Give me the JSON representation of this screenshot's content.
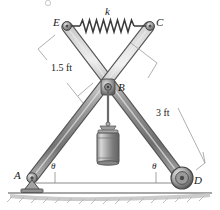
{
  "figure": {
    "background_color": "#ffffff",
    "ink_color": "#1a1a1a",
    "member_color": "#8c8c8c",
    "member_dark": "#595959",
    "member_light": "#c9c9c9",
    "ground_color": "#b5b5b5"
  },
  "labels": {
    "point_a": "A",
    "point_b": "B",
    "point_c": "C",
    "point_d": "D",
    "point_e": "E",
    "spring_k": "k",
    "dim_half": "1.5 ft",
    "dim_full": "3 ft",
    "angle_left": "θ",
    "angle_right": "θ"
  },
  "geometry": {
    "point_a": {
      "x": 30,
      "y": 178
    },
    "point_b": {
      "x": 108,
      "y": 86
    },
    "point_c": {
      "x": 150,
      "y": 25
    },
    "point_d": {
      "x": 182,
      "y": 178
    },
    "point_e": {
      "x": 66,
      "y": 25
    },
    "member_ac_length_ft": 3,
    "member_ed_length_ft": 3,
    "half_member_length_ft": 1.5,
    "spring_coils": 13
  },
  "supports": {
    "a": "pin-support",
    "d": "roller-support",
    "b": "pin-joint",
    "c": "pin-joint",
    "e": "pin-joint"
  },
  "load": {
    "type": "suspended-cylindrical-weight",
    "attached_at": "B"
  },
  "icons": {
    "spring": "spring-icon",
    "pin_support": "pin-support-icon",
    "roller_support": "roller-support-icon",
    "weight": "cylinder-weight-icon",
    "ground": "ground-hatch-icon"
  }
}
